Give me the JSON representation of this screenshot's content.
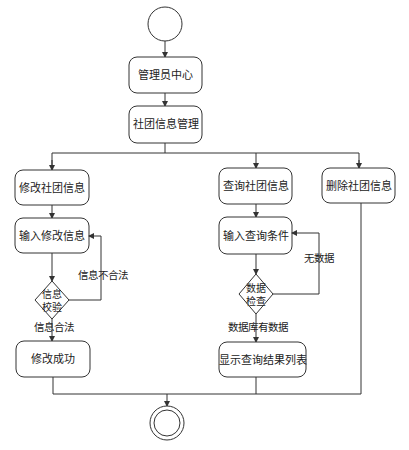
{
  "diagram": {
    "type": "activity-diagram",
    "start": {
      "label": ""
    },
    "end": {
      "label": ""
    },
    "nodes": {
      "admin_center": "管理员中心",
      "club_info_mgmt": "社团信息管理",
      "modify_club_info": "修改社团信息",
      "input_modify_info": "输入修改信息",
      "modify_success": "修改成功",
      "query_club_info": "查询社团信息",
      "input_query_cond": "输入查询条件",
      "show_query_results": "显示查询结果列表",
      "delete_club_info": "删除社团信息"
    },
    "decisions": {
      "info_check_line1": "信息",
      "info_check_line2": "校验",
      "data_check_line1": "数据",
      "data_check_line2": "检查"
    },
    "edge_labels": {
      "info_invalid": "信息不合法",
      "info_valid": "信息合法",
      "no_data": "无数据",
      "db_has_data": "数据库有数据"
    },
    "colors": {
      "stroke": "#333333",
      "background": "#ffffff",
      "text": "#222222"
    }
  }
}
